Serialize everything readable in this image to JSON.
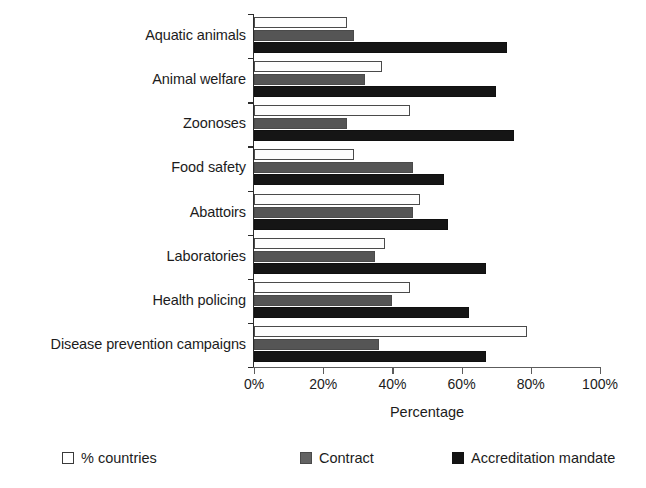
{
  "chart_data": {
    "type": "bar",
    "orientation": "horizontal",
    "title": "",
    "xlabel": "Percentage",
    "ylabel": "",
    "xlim": [
      0,
      100
    ],
    "xticks": [
      "0%",
      "20%",
      "40%",
      "60%",
      "80%",
      "100%"
    ],
    "xtick_values": [
      0,
      20,
      40,
      60,
      80,
      100
    ],
    "grid": false,
    "legend_position": "bottom",
    "categories": [
      "Aquatic animals",
      "Animal welfare",
      "Zoonoses",
      "Food safety",
      "Abattoirs",
      "Laboratories",
      "Health policing",
      "Disease prevention campaigns"
    ],
    "series": [
      {
        "name": "% countries",
        "color": "#ffffff",
        "values": [
          27,
          37,
          45,
          29,
          48,
          38,
          45,
          79
        ]
      },
      {
        "name": "Contract",
        "color": "#636363",
        "values": [
          29,
          32,
          27,
          46,
          46,
          35,
          40,
          36
        ]
      },
      {
        "name": "Accreditation mandate",
        "color": "#131313",
        "values": [
          73,
          70,
          75,
          55,
          56,
          67,
          62,
          67
        ]
      }
    ]
  },
  "legend": {
    "items": [
      {
        "label": "% countries",
        "swatch": "white"
      },
      {
        "label": "Contract",
        "swatch": "gray"
      },
      {
        "label": "Accreditation mandate",
        "swatch": "black"
      }
    ]
  },
  "axis": {
    "x_title": "Percentage"
  }
}
